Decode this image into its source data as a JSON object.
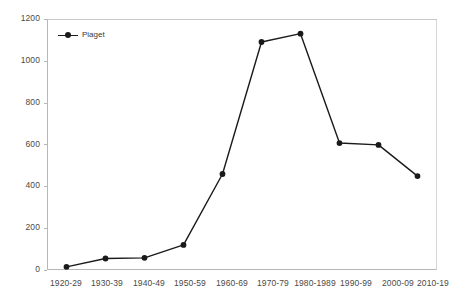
{
  "chart_data": {
    "type": "line",
    "title": "",
    "subtitle": "",
    "xlabel": "",
    "ylabel": "",
    "categories": [
      "1920-29",
      "1930-39",
      "1940-49",
      "1950-59",
      "1960-69",
      "1970-79",
      "1980-1989",
      "1990-99",
      "2000-09",
      "2010-19"
    ],
    "series": [
      {
        "name": "Piaget",
        "values": [
          15,
          55,
          58,
          120,
          459,
          1090,
          1130,
          607,
          598,
          449
        ],
        "color": "#1a1a1a",
        "marker": "circle"
      }
    ],
    "ylim": [
      0,
      1200
    ],
    "y_ticks": [
      0,
      200,
      400,
      600,
      800,
      1000,
      1200
    ],
    "y_tick_labels": [
      "0",
      "200",
      "400",
      "600",
      "800",
      "1000",
      "1200"
    ],
    "grid": false,
    "legend_position": "top-left",
    "legend_entries": [
      "Piaget"
    ],
    "annotations": []
  },
  "axes": {
    "axis_color": "#b7b7b7",
    "tick_label_color": "#4a4a4a"
  },
  "legend": {
    "label": "Piaget"
  }
}
